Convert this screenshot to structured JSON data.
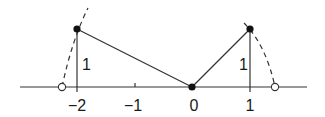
{
  "diagram": {
    "axis": {
      "tick_labels": [
        "−2",
        "−1",
        "0",
        "1"
      ],
      "tick_values": [
        -2,
        -1,
        0,
        1
      ]
    },
    "points": {
      "left_top": {
        "x": -2,
        "y": 1
      },
      "origin": {
        "x": 0,
        "y": 0
      },
      "right_top": {
        "x": 1,
        "y": 1
      }
    },
    "height_labels": [
      "1",
      "1"
    ],
    "hollow_points": [
      -2.24,
      1.41
    ],
    "colors": {
      "stroke": "#1a1a1a",
      "background": "#ffffff"
    }
  }
}
